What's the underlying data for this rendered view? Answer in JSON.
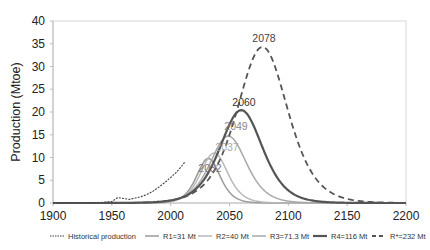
{
  "chart_data": {
    "type": "line",
    "title": "",
    "xlabel": "",
    "ylabel": "Production (Mtoe)",
    "xlim": [
      1900,
      2200
    ],
    "ylim": [
      0,
      40
    ],
    "x_ticks": [
      1900,
      1950,
      2000,
      2050,
      2100,
      2150,
      2200
    ],
    "y_ticks": [
      0,
      5,
      10,
      15,
      20,
      25,
      30,
      35,
      40
    ],
    "grid": false,
    "legend_position": "bottom",
    "series": [
      {
        "name": "Historical production",
        "style": "dotted",
        "color": "#444444",
        "peak_year": null,
        "peak_value": null,
        "x": [
          1900,
          1940,
          1950,
          1955,
          1960,
          1965,
          1970,
          1975,
          1980,
          1985,
          1990,
          1995,
          2000,
          2005,
          2010,
          2012
        ],
        "values": [
          0,
          0.1,
          0.3,
          1.2,
          1.0,
          0.8,
          1.1,
          1.4,
          1.9,
          2.6,
          3.5,
          4.5,
          5.6,
          6.8,
          8.3,
          9.0
        ]
      },
      {
        "name": "R1=31 Mt",
        "style": "solid",
        "color": "#9a9a9a",
        "peak_year": 2032,
        "peak_value": 9.8,
        "urr": 31
      },
      {
        "name": "R2=40 Mt",
        "style": "solid",
        "color": "#b8b8b8",
        "peak_year": 2037,
        "peak_value": 11.0,
        "urr": 40
      },
      {
        "name": "R3=71.3 Mt",
        "style": "solid",
        "color": "#a8a8a8",
        "peak_year": 2049,
        "peak_value": 14.7,
        "urr": 71.3
      },
      {
        "name": "R4=116 Mt",
        "style": "solid-thick",
        "color": "#555555",
        "peak_year": 2060,
        "peak_value": 20.4,
        "urr": 116
      },
      {
        "name": "R*=232 Mt",
        "style": "dashed",
        "color": "#555555",
        "peak_year": 2078,
        "peak_value": 34.3,
        "urr": 232
      }
    ],
    "annotations": [
      {
        "text": "2078",
        "series": "R*=232 Mt"
      },
      {
        "text": "2060",
        "series": "R4=116 Mt"
      },
      {
        "text": "2049",
        "series": "R3=71.3 Mt"
      },
      {
        "text": "2037",
        "series": "R2=40 Mt"
      },
      {
        "text": "2032",
        "series": "R1=31 Mt"
      }
    ]
  },
  "legend": {
    "items": [
      {
        "label": "Historical production"
      },
      {
        "label": "R1=31 Mt"
      },
      {
        "label": "R2=40 Mt"
      },
      {
        "label": "R3=71.3 Mt"
      },
      {
        "label": "R4=116 Mt"
      },
      {
        "label": "R*=232 Mt"
      }
    ]
  },
  "axis": {
    "ylabel": "Production (Mtoe)",
    "x_labels": [
      "1900",
      "1950",
      "2000",
      "2050",
      "2100",
      "2150",
      "2200"
    ],
    "y_labels": [
      "0",
      "5",
      "10",
      "15",
      "20",
      "25",
      "30",
      "35",
      "40"
    ]
  },
  "peak_labels": [
    "2078",
    "2060",
    "2049",
    "2037",
    "2032"
  ]
}
